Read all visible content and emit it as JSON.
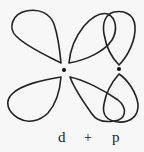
{
  "diagram": {
    "stroke_color": "#222222",
    "background": "#f7f7f7",
    "labels": {
      "d": "d",
      "plus": "+",
      "p": "p"
    },
    "nuclei": [
      {
        "name": "d-center",
        "x": 64,
        "y": 70
      },
      {
        "name": "p-center",
        "x": 119,
        "y": 69
      }
    ],
    "lobes": [
      {
        "name": "d-lobe-upper-left",
        "orbital": "d"
      },
      {
        "name": "d-lobe-lower-left",
        "orbital": "d"
      },
      {
        "name": "d-lobe-upper-right",
        "orbital": "d"
      },
      {
        "name": "d-lobe-lower-right",
        "orbital": "d"
      },
      {
        "name": "p-lobe-upper",
        "orbital": "p"
      },
      {
        "name": "p-lobe-lower",
        "orbital": "p"
      }
    ]
  }
}
